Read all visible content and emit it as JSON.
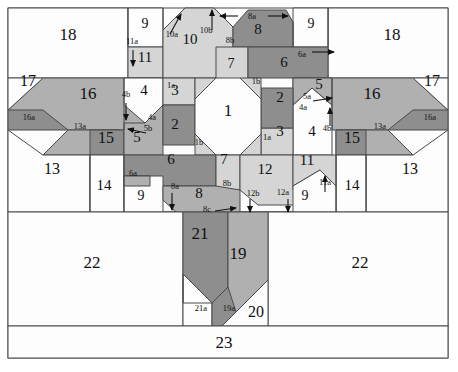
{
  "figure": {
    "title": "",
    "type": "geometric-dissection-diagram",
    "width": 458,
    "height": 372,
    "background": "#ffffff",
    "stroke": "#3c3c3c",
    "frame": {
      "x": 8,
      "y": 8,
      "w": 440,
      "h": 350
    }
  },
  "palette": {
    "white": "#fdfdfd",
    "light_gray": "#d5d5d5",
    "mid_gray": "#b0b0b0",
    "dark_gray": "#8e8e8e",
    "outline": "#4a4a4a",
    "text": "#101010"
  },
  "pieces": [
    {
      "id": "1",
      "label": "1",
      "fill": "white",
      "lx": 228,
      "ly": 116,
      "size": 17
    },
    {
      "id": "2L",
      "label": "2",
      "fill": "dark_gray",
      "lx": 175,
      "ly": 129,
      "size": 15
    },
    {
      "id": "2R",
      "label": "2",
      "fill": "dark_gray",
      "lx": 280,
      "ly": 102,
      "size": 15
    },
    {
      "id": "3L",
      "label": "3",
      "fill": "light_gray",
      "lx": 175,
      "ly": 95,
      "size": 15
    },
    {
      "id": "3R",
      "label": "3",
      "fill": "light_gray",
      "lx": 280,
      "ly": 136,
      "size": 15
    },
    {
      "id": "4L",
      "label": "4",
      "fill": "white",
      "lx": 144,
      "ly": 95,
      "size": 15
    },
    {
      "id": "4R",
      "label": "4",
      "fill": "white",
      "lx": 312,
      "ly": 136,
      "size": 15
    },
    {
      "id": "5L",
      "label": "5",
      "fill": "mid_gray",
      "lx": 137,
      "ly": 142,
      "size": 15
    },
    {
      "id": "5R",
      "label": "5",
      "fill": "mid_gray",
      "lx": 319,
      "ly": 89,
      "size": 15
    },
    {
      "id": "6L",
      "label": "6",
      "fill": "dark_gray",
      "lx": 171,
      "ly": 164,
      "size": 15
    },
    {
      "id": "6R",
      "label": "6",
      "fill": "dark_gray",
      "lx": 284,
      "ly": 67,
      "size": 15
    },
    {
      "id": "7L",
      "label": "7",
      "fill": "light_gray",
      "lx": 231,
      "ly": 68,
      "size": 14
    },
    {
      "id": "7R",
      "label": "7",
      "fill": "light_gray",
      "lx": 224,
      "ly": 164,
      "size": 14
    },
    {
      "id": "8",
      "label": "8",
      "fill": "dark_gray",
      "lx": 258,
      "ly": 34,
      "size": 15
    },
    {
      "id": "8b",
      "label": "8",
      "fill": "mid_gray",
      "lx": 199,
      "ly": 198,
      "size": 15
    },
    {
      "id": "9a",
      "label": "9",
      "fill": "white",
      "lx": 145,
      "ly": 28,
      "size": 14
    },
    {
      "id": "9b",
      "label": "9",
      "fill": "white",
      "lx": 311,
      "ly": 28,
      "size": 14
    },
    {
      "id": "9c",
      "label": "9",
      "fill": "white",
      "lx": 141,
      "ly": 200,
      "size": 14
    },
    {
      "id": "9d",
      "label": "9",
      "fill": "white",
      "lx": 305,
      "ly": 200,
      "size": 14
    },
    {
      "id": "10",
      "label": "10",
      "fill": "light_gray",
      "lx": 190,
      "ly": 44,
      "size": 15
    },
    {
      "id": "11a",
      "label": "11",
      "fill": "light_gray",
      "lx": 145,
      "ly": 62,
      "size": 15
    },
    {
      "id": "11b",
      "label": "11",
      "fill": "light_gray",
      "lx": 307,
      "ly": 165,
      "size": 15
    },
    {
      "id": "12",
      "label": "12",
      "fill": "light_gray",
      "lx": 265,
      "ly": 174,
      "size": 15
    },
    {
      "id": "13L",
      "label": "13",
      "fill": "white",
      "lx": 52,
      "ly": 174,
      "size": 16
    },
    {
      "id": "13R",
      "label": "13",
      "fill": "white",
      "lx": 410,
      "ly": 174,
      "size": 16
    },
    {
      "id": "14L",
      "label": "14",
      "fill": "white",
      "lx": 104,
      "ly": 190,
      "size": 15
    },
    {
      "id": "14R",
      "label": "14",
      "fill": "white",
      "lx": 352,
      "ly": 190,
      "size": 15
    },
    {
      "id": "15L",
      "label": "15",
      "fill": "dark_gray",
      "lx": 106,
      "ly": 143,
      "size": 16
    },
    {
      "id": "15R",
      "label": "15",
      "fill": "dark_gray",
      "lx": 352,
      "ly": 143,
      "size": 16
    },
    {
      "id": "16L",
      "label": "16",
      "fill": "mid_gray",
      "lx": 88,
      "ly": 99,
      "size": 17
    },
    {
      "id": "16R",
      "label": "16",
      "fill": "mid_gray",
      "lx": 372,
      "ly": 99,
      "size": 17
    },
    {
      "id": "17L",
      "label": "17",
      "fill": "white",
      "lx": 28,
      "ly": 86,
      "size": 16
    },
    {
      "id": "17R",
      "label": "17",
      "fill": "white",
      "lx": 432,
      "ly": 86,
      "size": 16
    },
    {
      "id": "18L",
      "label": "18",
      "fill": "white",
      "lx": 68,
      "ly": 40,
      "size": 17
    },
    {
      "id": "18R",
      "label": "18",
      "fill": "white",
      "lx": 392,
      "ly": 40,
      "size": 17
    },
    {
      "id": "19",
      "label": "19",
      "fill": "mid_gray",
      "lx": 238,
      "ly": 259,
      "size": 17
    },
    {
      "id": "20",
      "label": "20",
      "fill": "white",
      "lx": 256,
      "ly": 317,
      "size": 16
    },
    {
      "id": "21",
      "label": "21",
      "fill": "dark_gray",
      "lx": 200,
      "ly": 239,
      "size": 17
    },
    {
      "id": "22L",
      "label": "22",
      "fill": "white",
      "lx": 92,
      "ly": 268,
      "size": 17
    },
    {
      "id": "22R",
      "label": "22",
      "fill": "white",
      "lx": 360,
      "ly": 268,
      "size": 17
    },
    {
      "id": "23",
      "label": "23",
      "fill": "white",
      "lx": 224,
      "ly": 348,
      "size": 17
    }
  ],
  "sublabels": [
    {
      "id": "s-1a-L",
      "label": "1a",
      "x": 171,
      "y": 88
    },
    {
      "id": "s-1a-R",
      "label": "1a",
      "x": 267,
      "y": 140
    },
    {
      "id": "s-1b-L",
      "label": "1b",
      "x": 199,
      "y": 145
    },
    {
      "id": "s-1b-R",
      "label": "1b",
      "x": 256,
      "y": 84
    },
    {
      "id": "s-4a-L",
      "label": "4a",
      "x": 152,
      "y": 120
    },
    {
      "id": "s-4a-R",
      "label": "4a",
      "x": 303,
      "y": 110
    },
    {
      "id": "s-4b-L",
      "label": "4b",
      "x": 126,
      "y": 97
    },
    {
      "id": "s-4b-R",
      "label": "4b",
      "x": 327,
      "y": 131
    },
    {
      "id": "s-5a",
      "label": "5a",
      "x": 307,
      "y": 99
    },
    {
      "id": "s-5b",
      "label": "5b",
      "x": 148,
      "y": 131
    },
    {
      "id": "s-6a-L",
      "label": "6a",
      "x": 133,
      "y": 176
    },
    {
      "id": "s-6a-R",
      "label": "6a",
      "x": 302,
      "y": 57
    },
    {
      "id": "s-8a-T",
      "label": "8a",
      "x": 252,
      "y": 19
    },
    {
      "id": "s-8a-B",
      "label": "8a",
      "x": 175,
      "y": 189
    },
    {
      "id": "s-8b-T",
      "label": "8b",
      "x": 230,
      "y": 43
    },
    {
      "id": "s-8b-B",
      "label": "8b",
      "x": 227,
      "y": 186
    },
    {
      "id": "s-8c",
      "label": "8c",
      "x": 207,
      "y": 212
    },
    {
      "id": "s-10a",
      "label": "10a",
      "x": 172,
      "y": 37
    },
    {
      "id": "s-10b",
      "label": "10b",
      "x": 206,
      "y": 33
    },
    {
      "id": "s-11a-L",
      "label": "11a",
      "x": 132,
      "y": 44
    },
    {
      "id": "s-11a-R",
      "label": "11a",
      "x": 325,
      "y": 185
    },
    {
      "id": "s-12a",
      "label": "12a",
      "x": 283,
      "y": 195
    },
    {
      "id": "s-12b",
      "label": "12b",
      "x": 253,
      "y": 196
    },
    {
      "id": "s-13a-L",
      "label": "13a",
      "x": 80,
      "y": 129
    },
    {
      "id": "s-13a-R",
      "label": "13a",
      "x": 380,
      "y": 129
    },
    {
      "id": "s-16a-L",
      "label": "16a",
      "x": 29,
      "y": 120
    },
    {
      "id": "s-16a-R",
      "label": "16a",
      "x": 430,
      "y": 120
    },
    {
      "id": "s-19a",
      "label": "19a",
      "x": 229,
      "y": 311
    },
    {
      "id": "s-21a",
      "label": "21a",
      "x": 201,
      "y": 311
    }
  ]
}
